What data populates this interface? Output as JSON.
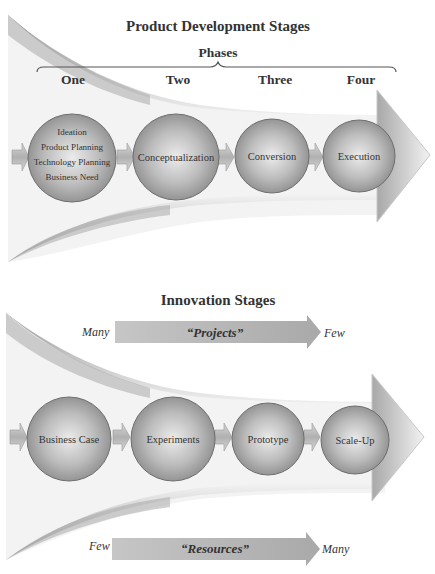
{
  "diagram1": {
    "title": "Product Development Stages",
    "bracket_label": "Phases",
    "phases": [
      "One",
      "Two",
      "Three",
      "Four"
    ],
    "stages": [
      {
        "lines": [
          "Ideation",
          "Product Planning",
          "Technology Planning",
          "Business Need"
        ]
      },
      {
        "lines": [
          "Conceptualization"
        ]
      },
      {
        "lines": [
          "Conversion"
        ]
      },
      {
        "lines": [
          "Execution"
        ]
      }
    ]
  },
  "diagram2": {
    "title": "Innovation Stages",
    "projects_arrow": {
      "left": "Many",
      "label": "“Projects”",
      "right": "Few"
    },
    "stages": [
      {
        "lines": [
          "Business Case"
        ]
      },
      {
        "lines": [
          "Experiments"
        ]
      },
      {
        "lines": [
          "Prototype"
        ]
      },
      {
        "lines": [
          "Scale-Up"
        ]
      }
    ],
    "resources_arrow": {
      "left": "Few",
      "label": "“Resources”",
      "right": "Many"
    }
  },
  "colors": {
    "circle_fill_center": "#e6e6e6",
    "circle_fill_edge": "#8e8e8e",
    "circle_stroke": "#6e6e6e",
    "funnel_dark": "#9a9a9a",
    "bar_fill": "#bdbdbd",
    "text": "#333333"
  }
}
